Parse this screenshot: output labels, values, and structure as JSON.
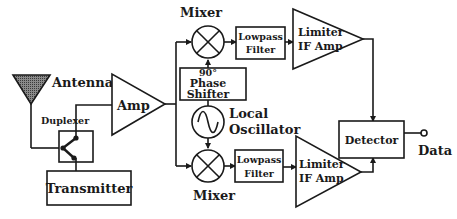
{
  "diagram": {
    "colors": {
      "line": "#1a1a1a",
      "antenna_fill": "#6b6b6b",
      "background": "#ffffff"
    },
    "labels": {
      "antenna": "Antenna",
      "duplexer": "Duplexer",
      "transmitter": "Transmitter",
      "amp": "Amp",
      "mixer_top": "Mixer",
      "mixer_bottom": "Mixer",
      "phase_shifter_line1": "90°",
      "phase_shifter_line2": "Phase",
      "phase_shifter_line3": "Shifter",
      "local_osc_line1": "Local",
      "local_osc_line2": "Oscillator",
      "lpf_top_line1": "Lowpass",
      "lpf_top_line2": "Filter",
      "lpf_bottom_line1": "Lowpass",
      "lpf_bottom_line2": "Filter",
      "limiter_top_line1": "Limiter",
      "limiter_top_line2": "IF Amp",
      "limiter_bottom_line1": "Limiter",
      "limiter_bottom_line2": "IF Amp",
      "detector": "Detector",
      "data": "Data"
    },
    "nodes": [
      {
        "id": "antenna",
        "shape": "triangle"
      },
      {
        "id": "duplexer",
        "shape": "box-switch"
      },
      {
        "id": "transmitter",
        "shape": "box"
      },
      {
        "id": "amp",
        "shape": "triangle"
      },
      {
        "id": "mixer_top",
        "shape": "circle-x"
      },
      {
        "id": "phase_shifter",
        "shape": "box"
      },
      {
        "id": "local_oscillator",
        "shape": "circle-sine"
      },
      {
        "id": "mixer_bottom",
        "shape": "circle-x"
      },
      {
        "id": "lpf_top",
        "shape": "box"
      },
      {
        "id": "lpf_bottom",
        "shape": "box"
      },
      {
        "id": "limiter_top",
        "shape": "triangle"
      },
      {
        "id": "limiter_bottom",
        "shape": "triangle"
      },
      {
        "id": "detector",
        "shape": "box"
      },
      {
        "id": "data_out",
        "shape": "terminal"
      }
    ],
    "edges": [
      [
        "antenna",
        "duplexer"
      ],
      [
        "duplexer",
        "amp"
      ],
      [
        "transmitter",
        "duplexer"
      ],
      [
        "amp",
        "mixer_top"
      ],
      [
        "amp",
        "mixer_bottom"
      ],
      [
        "local_oscillator",
        "phase_shifter"
      ],
      [
        "phase_shifter",
        "mixer_top"
      ],
      [
        "local_oscillator",
        "mixer_bottom"
      ],
      [
        "mixer_top",
        "lpf_top"
      ],
      [
        "mixer_bottom",
        "lpf_bottom"
      ],
      [
        "lpf_top",
        "limiter_top"
      ],
      [
        "lpf_bottom",
        "limiter_bottom"
      ],
      [
        "limiter_top",
        "detector"
      ],
      [
        "limiter_bottom",
        "detector"
      ],
      [
        "detector",
        "data_out"
      ]
    ]
  }
}
